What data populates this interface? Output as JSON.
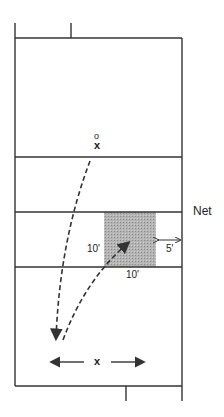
{
  "diagram": {
    "net_label": "Net",
    "zone_width_label": "10'",
    "zone_depth_label": "10'",
    "sideline_gap_label": "5'",
    "player_top_symbol": "o",
    "player_top_marker": "x",
    "player_bottom_marker": "x",
    "colors": {
      "lines": "#333333",
      "shaded_zone": "#a8a8a8"
    }
  }
}
